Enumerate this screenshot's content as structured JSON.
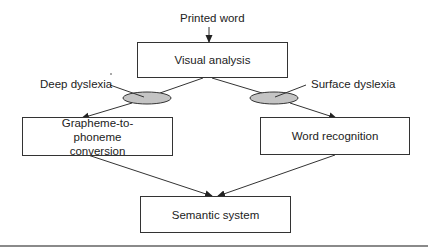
{
  "diagram": {
    "input_label": "Printed word",
    "nodes": {
      "visual_analysis": "Visual analysis",
      "grapheme_to_phoneme": "Grapheme-to-phoneme conversion",
      "word_recognition": "Word recognition",
      "semantic_system": "Semantic system"
    },
    "lesion_labels": {
      "left": "Deep dyslexia",
      "right": "Surface dyslexia"
    },
    "edges": [
      {
        "from": "Printed word",
        "to": "Visual analysis"
      },
      {
        "from": "Visual analysis",
        "to": "Grapheme-to-phoneme conversion",
        "lesion": "Deep dyslexia"
      },
      {
        "from": "Visual analysis",
        "to": "Word recognition",
        "lesion": "Surface dyslexia"
      },
      {
        "from": "Grapheme-to-phoneme conversion",
        "to": "Semantic system"
      },
      {
        "from": "Word recognition",
        "to": "Semantic system"
      }
    ],
    "colors": {
      "line": "#333333",
      "lesion_fill": "#c4c4c4",
      "bottom_rule": "#8a8a8a"
    }
  }
}
